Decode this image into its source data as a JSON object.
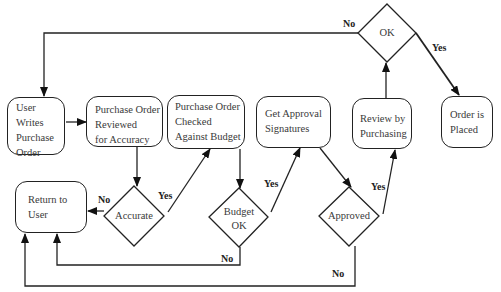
{
  "diagram": {
    "type": "flowchart",
    "nodes": {
      "user_writes": {
        "lines": [
          "User",
          "Writes",
          "Purchase",
          "Order"
        ]
      },
      "po_reviewed": {
        "lines": [
          "Purchase Order",
          "Reviewed",
          "for Accuracy"
        ]
      },
      "po_checked": {
        "lines": [
          "Purchase Order",
          "Checked",
          "Against Budget"
        ]
      },
      "get_approval": {
        "lines": [
          "Get Approval",
          "Signatures"
        ]
      },
      "review_purchasing": {
        "lines": [
          "Review by",
          "Purchasing"
        ]
      },
      "order_placed": {
        "lines": [
          "Order is",
          "Placed"
        ]
      },
      "return_user": {
        "lines": [
          "Return to",
          "User"
        ]
      },
      "accurate": {
        "lines": [
          "Accurate"
        ]
      },
      "budget_ok": {
        "lines": [
          "Budget",
          "OK"
        ]
      },
      "approved": {
        "lines": [
          "Approved"
        ]
      },
      "ok": {
        "lines": [
          "OK"
        ]
      }
    },
    "edge_labels": {
      "ok_no": "No",
      "ok_yes": "Yes",
      "accurate_no": "No",
      "accurate_yes": "Yes",
      "budget_yes": "Yes",
      "budget_no": "No",
      "approved_yes": "Yes",
      "approved_no": "No"
    },
    "edges": [
      {
        "from": "user_writes",
        "to": "po_reviewed"
      },
      {
        "from": "po_reviewed",
        "to": "accurate"
      },
      {
        "from": "accurate",
        "to": "return_user",
        "label": "No"
      },
      {
        "from": "accurate",
        "to": "po_checked",
        "label": "Yes"
      },
      {
        "from": "po_checked",
        "to": "budget_ok"
      },
      {
        "from": "budget_ok",
        "to": "get_approval",
        "label": "Yes"
      },
      {
        "from": "budget_ok",
        "to": "return_user",
        "label": "No"
      },
      {
        "from": "get_approval",
        "to": "approved"
      },
      {
        "from": "approved",
        "to": "review_purchasing",
        "label": "Yes"
      },
      {
        "from": "approved",
        "to": "return_user",
        "label": "No"
      },
      {
        "from": "review_purchasing",
        "to": "ok"
      },
      {
        "from": "ok",
        "to": "order_placed",
        "label": "Yes"
      },
      {
        "from": "ok",
        "to": "user_writes",
        "label": "No"
      }
    ]
  }
}
